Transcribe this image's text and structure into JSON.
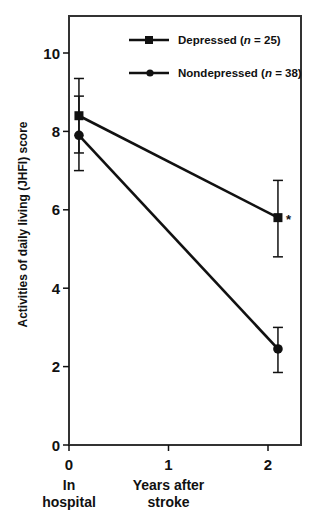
{
  "chart_data": {
    "type": "line",
    "title": "",
    "xlabel": "Years after stroke",
    "ylabel": "Activities of daily living (JHFI) score",
    "x_ticks": [
      0,
      1,
      2
    ],
    "x_tick_labels": [
      "0",
      "1",
      "2"
    ],
    "x_captions": [
      {
        "x": 0,
        "lines": [
          "In",
          "hospital"
        ]
      },
      {
        "x": 1,
        "lines": [
          "Years after",
          "stroke"
        ]
      }
    ],
    "y_ticks": [
      0,
      2,
      4,
      6,
      8,
      10
    ],
    "y_tick_labels": [
      "0",
      "2",
      "4",
      "6",
      "8",
      "10"
    ],
    "xlim": [
      0,
      2.35
    ],
    "ylim": [
      0,
      11
    ],
    "grid": false,
    "legend_position": "top-center inside plot",
    "x": [
      0.1,
      2.1
    ],
    "series": [
      {
        "name": "Depressed",
        "n_label": "n",
        "n_value": "= 25)",
        "legend_prefix": "Depressed (",
        "marker": "square",
        "values": [
          8.4,
          5.8
        ],
        "error_upper": [
          9.35,
          6.75
        ],
        "error_lower": [
          7.45,
          4.8
        ]
      },
      {
        "name": "Nondepressed",
        "n_label": "n",
        "n_value": "= 38)",
        "legend_prefix": "Nondepressed (",
        "marker": "circle",
        "values": [
          7.9,
          2.45
        ],
        "error_upper": [
          8.9,
          3.0
        ],
        "error_lower": [
          7.0,
          1.85
        ]
      }
    ],
    "annotations": [
      {
        "text": "*",
        "x": 2.1,
        "y": 5.8,
        "series": "Depressed"
      }
    ]
  },
  "colors": {
    "ink": "#111111",
    "frame": "#333333",
    "background": "#ffffff"
  }
}
